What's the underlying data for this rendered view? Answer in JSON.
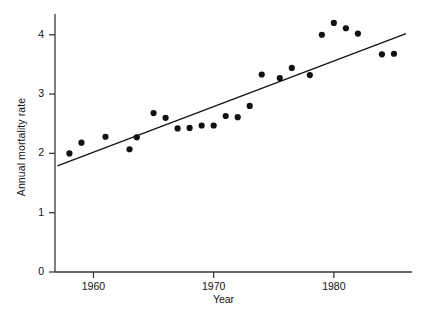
{
  "chart_data": {
    "type": "scatter",
    "title": "",
    "xlabel": "Year",
    "ylabel": "Annual mortality rate",
    "xlim": [
      1956.8,
      1986.5
    ],
    "ylim": [
      0,
      4.35
    ],
    "grid": false,
    "legend": null,
    "xticks": [
      1960,
      1970,
      1980
    ],
    "xtick_labels": [
      "1960",
      "1970",
      "1980"
    ],
    "yticks": [
      0,
      1,
      2,
      3,
      4
    ],
    "ytick_labels": [
      "0",
      "1",
      "2",
      "3",
      "4"
    ],
    "marker": {
      "shape": "filled-circle",
      "color": "#111111",
      "size_px": 6.2
    },
    "x": [
      1958,
      1959,
      1961,
      1963,
      1963.6,
      1965,
      1966,
      1967,
      1968,
      1969,
      1970,
      1971,
      1972,
      1973,
      1974,
      1975.5,
      1976.5,
      1978,
      1979,
      1980,
      1981,
      1982,
      1984,
      1985
    ],
    "y": [
      2.0,
      2.18,
      2.28,
      2.07,
      2.27,
      2.68,
      2.6,
      2.42,
      2.43,
      2.47,
      2.47,
      2.63,
      2.61,
      2.8,
      3.33,
      3.27,
      3.44,
      3.32,
      4.0,
      4.2,
      4.11,
      4.02,
      3.67,
      3.68
    ],
    "trend_line": {
      "kind": "least-squares-fit",
      "color": "#111111",
      "width_px": 1.2,
      "x_start": 1957.0,
      "y_start": 1.79,
      "x_end": 1986.0,
      "y_end": 4.02
    }
  },
  "axes": {
    "y_axis_label": "Annual mortality rate",
    "x_axis_label": "Year"
  }
}
